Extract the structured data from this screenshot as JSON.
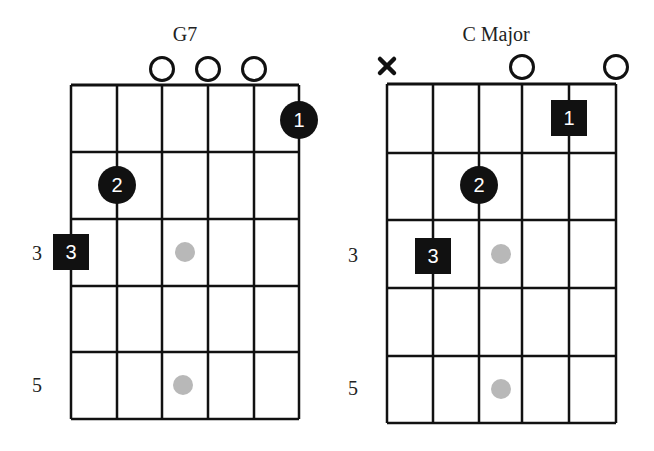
{
  "diagram": {
    "colors": {
      "grid": "#111111",
      "marker": "#111111",
      "marker_text": "#ffffff",
      "inlay": "#b8b8b8",
      "background": "#ffffff"
    }
  },
  "chords": [
    {
      "name": "G7",
      "title_pos": [
        185,
        34
      ],
      "grid": {
        "strings_x": [
          71,
          117,
          162,
          208,
          254,
          299
        ],
        "frets_y": [
          85,
          152,
          219,
          286,
          352,
          419
        ]
      },
      "open_strings": [
        3,
        4,
        5
      ],
      "muted_strings": [],
      "string_indicator_y": 69,
      "fingers": [
        {
          "finger": "1",
          "string": 6,
          "fret": 1,
          "shape": "circle",
          "cy": 120
        },
        {
          "finger": "2",
          "string": 2,
          "fret": 2,
          "shape": "circle",
          "cy": 185
        },
        {
          "finger": "3",
          "string": 1,
          "fret": 3,
          "shape": "square",
          "cy": 252
        }
      ],
      "inlays": [
        {
          "fret": 3,
          "cx": 185,
          "cy": 252
        },
        {
          "fret": 5,
          "cx": 183,
          "cy": 385
        }
      ],
      "fret_labels": [
        {
          "text": "3",
          "x": 37,
          "y": 253
        },
        {
          "text": "5",
          "x": 37,
          "y": 385
        }
      ]
    },
    {
      "name": "C Major",
      "title_pos": [
        496,
        34
      ],
      "grid": {
        "strings_x": [
          387,
          433,
          479,
          522,
          569,
          616
        ],
        "frets_y": [
          84,
          153,
          220,
          288,
          356,
          423
        ]
      },
      "open_strings": [
        4,
        6
      ],
      "muted_strings": [
        1
      ],
      "string_indicator_y": 67,
      "fingers": [
        {
          "finger": "1",
          "string": 5,
          "fret": 1,
          "shape": "square",
          "cy": 118
        },
        {
          "finger": "2",
          "string": 3,
          "fret": 2,
          "shape": "circle",
          "cy": 185
        },
        {
          "finger": "3",
          "string": 2,
          "fret": 3,
          "shape": "square",
          "cy": 256
        }
      ],
      "inlays": [
        {
          "fret": 3,
          "cx": 501,
          "cy": 254
        },
        {
          "fret": 5,
          "cx": 501,
          "cy": 389
        }
      ],
      "fret_labels": [
        {
          "text": "3",
          "x": 353,
          "y": 255
        },
        {
          "text": "5",
          "x": 353,
          "y": 388
        }
      ]
    }
  ],
  "icons": {
    "open_string": "open-circle",
    "muted_string": "x-mark",
    "finger_circle": "filled-circle",
    "finger_square": "filled-square",
    "inlay": "gray-dot"
  }
}
